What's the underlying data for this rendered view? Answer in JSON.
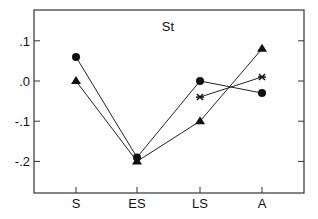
{
  "chart_data": {
    "type": "line",
    "title": "St",
    "xlabel": "",
    "ylabel": "",
    "categories": [
      "S",
      "ES",
      "LS",
      "A"
    ],
    "y_ticks": [
      ".1",
      ".0",
      "-.1",
      "-.2"
    ],
    "y_tick_values": [
      0.1,
      0.0,
      -0.1,
      -0.2
    ],
    "ylim": [
      -0.28,
      0.2
    ],
    "grid": false,
    "legend": null,
    "series": [
      {
        "name": "circle",
        "marker": "circle",
        "values": [
          0.06,
          -0.19,
          0.0,
          -0.03
        ]
      },
      {
        "name": "triangle",
        "marker": "triangle",
        "values": [
          0.0,
          -0.2,
          -0.1,
          0.08
        ]
      },
      {
        "name": "star",
        "marker": "star",
        "values": [
          null,
          null,
          -0.04,
          0.01
        ]
      }
    ]
  }
}
